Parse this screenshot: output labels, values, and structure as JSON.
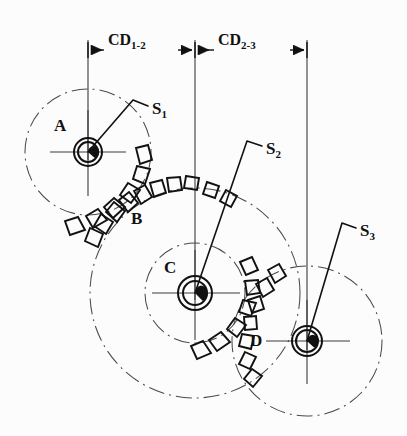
{
  "figure": {
    "background_color": "#fcfcfc",
    "line_color": "#1a1a1a",
    "thin_line_color": "#555555"
  },
  "dimensions": [
    {
      "id": "cd-1-2",
      "base": "CD",
      "subscript": "1-2",
      "from_x": 88,
      "to_x": 195,
      "y": 50,
      "label_x": 108,
      "label_y": 40
    },
    {
      "id": "cd-2-3",
      "base": "CD",
      "subscript": "2-3",
      "from_x": 195,
      "to_x": 307,
      "y": 50,
      "label_x": 218,
      "label_y": 40
    }
  ],
  "gears": [
    {
      "id": "gear-a",
      "label": "A",
      "label_x": 54,
      "label_y": 117,
      "center_x": 88,
      "center_y": 152,
      "pitch_radius": 63,
      "hub_outer_radius": 14,
      "hub_inner_radius": 10,
      "bore_radius": 6
    },
    {
      "id": "gear-b",
      "label": "B",
      "label_x": 131,
      "label_y": 210,
      "center_x": 195,
      "center_y": 293,
      "pitch_radius": 105,
      "hub_outer_radius": 0,
      "hub_inner_radius": 0,
      "bore_radius": 0
    },
    {
      "id": "gear-c",
      "label": "C",
      "label_x": 164,
      "label_y": 259,
      "center_x": 195,
      "center_y": 293,
      "pitch_radius": 50,
      "hub_outer_radius": 17,
      "hub_inner_radius": 12,
      "bore_radius": 7
    },
    {
      "id": "gear-d",
      "label": "D",
      "label_x": 250,
      "label_y": 332,
      "center_x": 307,
      "center_y": 341,
      "pitch_radius": 75,
      "hub_outer_radius": 15,
      "hub_inner_radius": 11,
      "bore_radius": 6
    }
  ],
  "shafts": [
    {
      "id": "shaft-1",
      "base": "S",
      "subscript": "1",
      "label_x": 152,
      "label_y": 100,
      "leader": [
        [
          148,
          106
        ],
        [
          133,
          100
        ],
        [
          88,
          152
        ]
      ]
    },
    {
      "id": "shaft-2",
      "base": "S",
      "subscript": "2",
      "label_x": 266,
      "label_y": 140,
      "leader": [
        [
          262,
          146
        ],
        [
          247,
          141
        ],
        [
          195,
          293
        ]
      ]
    },
    {
      "id": "shaft-3",
      "base": "S",
      "subscript": "3",
      "label_x": 360,
      "label_y": 222,
      "leader": [
        [
          356,
          228
        ],
        [
          342,
          223
        ],
        [
          307,
          341
        ]
      ]
    }
  ],
  "teeth_clusters": [
    {
      "id": "teeth-ab",
      "note": "meshing teeth between gear A and gear B"
    },
    {
      "id": "teeth-cd",
      "note": "meshing teeth between gear C and gear D"
    }
  ]
}
